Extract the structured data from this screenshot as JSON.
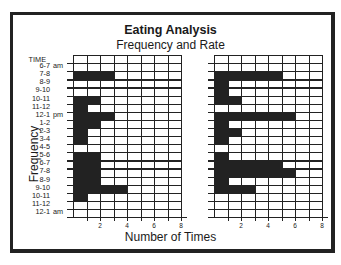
{
  "chart_data": [
    {
      "type": "bar",
      "orientation": "horizontal",
      "title": "Eating Analysis",
      "subtitle": "Frequency and Rate",
      "panel": "left",
      "xlabel": "Number of Times",
      "ylabel": "Frequency",
      "row_header": "TIME",
      "categories": [
        "6-7 am",
        "7-8",
        "8-9",
        "9-10",
        "10-11",
        "11-12",
        "12-1 pm",
        "1-2",
        "2-3",
        "3-4",
        "4-5",
        "5-6",
        "6-7",
        "7-8",
        "8-9",
        "9-10",
        "10-11",
        "11-12",
        "12-1 am"
      ],
      "values": [
        0,
        3,
        0,
        0,
        2,
        1,
        3,
        2,
        1,
        1,
        0,
        2,
        2,
        2,
        2,
        4,
        1,
        0,
        0
      ],
      "xlim": [
        0,
        8
      ],
      "xticks": [
        2,
        4,
        6,
        8
      ],
      "grid": true
    },
    {
      "type": "bar",
      "orientation": "horizontal",
      "panel": "right",
      "xlabel": "Number of Times",
      "categories": [
        "6-7 am",
        "7-8",
        "8-9",
        "9-10",
        "10-11",
        "11-12",
        "12-1 pm",
        "1-2",
        "2-3",
        "3-4",
        "4-5",
        "5-6",
        "6-7",
        "7-8",
        "8-9",
        "9-10",
        "10-11",
        "11-12",
        "12-1 am"
      ],
      "values": [
        0,
        5,
        1,
        1,
        2,
        0,
        6,
        1,
        2,
        1,
        0,
        1,
        5,
        6,
        1,
        3,
        0,
        0,
        0
      ],
      "xlim": [
        0,
        8
      ],
      "xticks": [
        2,
        4,
        6,
        8
      ],
      "grid": true
    }
  ],
  "header": {
    "title": "Eating Analysis",
    "subtitle": "Frequency and Rate"
  },
  "axes": {
    "ylabel": "Frequency",
    "xlabel": "Number of Times",
    "row_header": "TIME",
    "xtick_labels": [
      "2",
      "4",
      "6",
      "8"
    ]
  },
  "rows": [
    {
      "time": "6-7",
      "ampm": "am"
    },
    {
      "time": "7-8",
      "ampm": ""
    },
    {
      "time": "8-9",
      "ampm": ""
    },
    {
      "time": "9-10",
      "ampm": ""
    },
    {
      "time": "10-11",
      "ampm": ""
    },
    {
      "time": "11-12",
      "ampm": ""
    },
    {
      "time": "12-1",
      "ampm": "pm"
    },
    {
      "time": "1-2",
      "ampm": ""
    },
    {
      "time": "2-3",
      "ampm": ""
    },
    {
      "time": "3-4",
      "ampm": ""
    },
    {
      "time": "4-5",
      "ampm": ""
    },
    {
      "time": "5-6",
      "ampm": ""
    },
    {
      "time": "6-7",
      "ampm": ""
    },
    {
      "time": "7-8",
      "ampm": ""
    },
    {
      "time": "8-9",
      "ampm": ""
    },
    {
      "time": "9-10",
      "ampm": ""
    },
    {
      "time": "10-11",
      "ampm": ""
    },
    {
      "time": "11-12",
      "ampm": ""
    },
    {
      "time": "12-1",
      "ampm": "am"
    }
  ],
  "colors": {
    "ink": "#222222",
    "background": "#ffffff"
  }
}
